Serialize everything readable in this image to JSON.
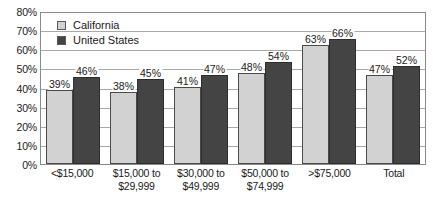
{
  "chart_data": {
    "type": "bar",
    "title": "",
    "subtitle": "",
    "xlabel": "",
    "ylabel": "",
    "ylim": [
      0,
      80
    ],
    "ytick_step": 10,
    "ytick_labels": [
      "0%",
      "10%",
      "20%",
      "30%",
      "40%",
      "50%",
      "60%",
      "70%",
      "80%"
    ],
    "grid": true,
    "legend_position": "top-left",
    "value_label_suffix": "%",
    "categories": [
      [
        "<$15,000"
      ],
      [
        "$15,000 to",
        "$29,999"
      ],
      [
        "$30,000 to",
        "$49,999"
      ],
      [
        "$50,000 to",
        "$74,999"
      ],
      [
        ">$75,000"
      ],
      [
        "Total"
      ]
    ],
    "series": [
      {
        "name": "California",
        "color": "#d2d2d2",
        "values": [
          39,
          38,
          41,
          48,
          63,
          47
        ],
        "value_labels": [
          "39%",
          "38%",
          "41%",
          "48%",
          "63%",
          "47%"
        ]
      },
      {
        "name": "United States",
        "color": "#444444",
        "values": [
          46,
          45,
          47,
          54,
          66,
          52
        ],
        "value_labels": [
          "46%",
          "45%",
          "47%",
          "54%",
          "66%",
          "52%"
        ]
      }
    ]
  }
}
